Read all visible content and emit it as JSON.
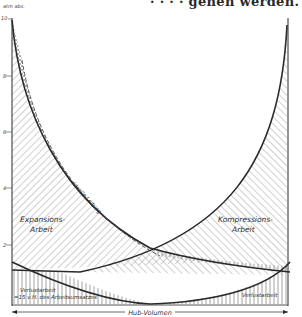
{
  "page_fragment": "· · · · gehen werden.",
  "diagram": {
    "y_axis": {
      "unit_label": "atm abs.",
      "ticks": [
        {
          "label": "10",
          "value": 10
        },
        {
          "label": "8",
          "value": 8
        },
        {
          "label": "6",
          "value": 6
        },
        {
          "label": "4",
          "value": 4
        },
        {
          "label": "2",
          "value": 2
        }
      ]
    },
    "labels": {
      "expansion": [
        "Expansions-",
        "Arbeit"
      ],
      "compression": [
        "Kompressions-",
        "Arbeit"
      ],
      "ideal_line": "ideelle Leitung",
      "loss_left": [
        "Verlustarbeit",
        "=15 v.H. des Arbeitsumsatzes"
      ],
      "loss_right": "Verlustarbeit",
      "stroke_volume": "Hub-Volumen"
    },
    "colors": {
      "ink": "#2a2a2a",
      "hatch": "#8a8a8a",
      "paper": "#ffffff"
    }
  }
}
